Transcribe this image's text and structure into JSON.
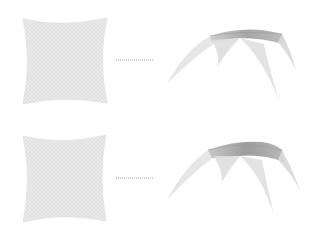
{
  "figure": {
    "rows": [
      {
        "id": "row-1",
        "flat_pattern": {
          "shape": "concave-square-mesh",
          "fill": "#e6e6e6",
          "stroke": "#d2d2d2"
        },
        "connector": {
          "style": "dotted",
          "color": "#9a9a9a"
        },
        "form_found_shell": {
          "shape": "four-leg-canopy",
          "fill_light": "#ececec",
          "fill_dark": "#a8a8a8"
        }
      },
      {
        "id": "row-2",
        "flat_pattern": {
          "shape": "concave-square-mesh",
          "fill": "#e6e6e6",
          "stroke": "#d2d2d2"
        },
        "connector": {
          "style": "dotted",
          "color": "#9a9a9a"
        },
        "form_found_shell": {
          "shape": "four-leg-canopy",
          "fill_light": "#ececec",
          "fill_dark": "#9e9e9e"
        }
      }
    ]
  }
}
